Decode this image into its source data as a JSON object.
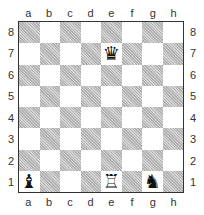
{
  "board": {
    "files": [
      "a",
      "b",
      "c",
      "d",
      "e",
      "f",
      "g",
      "h"
    ],
    "ranks": [
      "8",
      "7",
      "6",
      "5",
      "4",
      "3",
      "2",
      "1"
    ],
    "pieces": {
      "e7": {
        "glyph": "♛",
        "name": "black-queen"
      },
      "a1": {
        "glyph": "♝",
        "name": "black-bishop"
      },
      "e1": {
        "glyph": "♖",
        "name": "white-rook"
      },
      "g1": {
        "glyph": "♞",
        "name": "black-knight"
      }
    }
  }
}
